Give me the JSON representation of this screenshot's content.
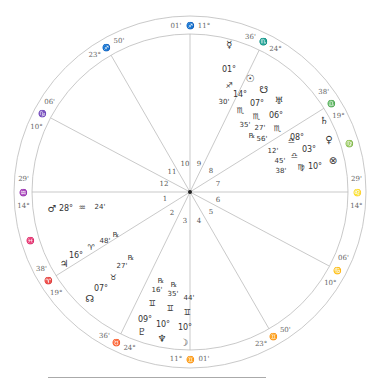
{
  "chart": {
    "center": [
      190,
      192
    ],
    "outer_radius": 176,
    "inner_radius": 158,
    "line_color": "#bbbbbb",
    "text_color": "#333333",
    "cusps": [
      {
        "house": 10,
        "deg": "11°",
        "sign": "♐",
        "min": "01'",
        "angle": 90
      },
      {
        "house": 11,
        "deg": "23°",
        "sign": "♐",
        "min": "50'",
        "angle": 120
      },
      {
        "house": 12,
        "deg": "10°",
        "sign": "♑",
        "min": "06'",
        "angle": 152
      },
      {
        "house": 1,
        "deg": "14°",
        "sign": "♒",
        "min": "29'",
        "angle": 180
      },
      {
        "house": 2,
        "deg": "19°",
        "sign": "♈",
        "min": "38'",
        "angle": 212
      },
      {
        "house": 3,
        "deg": "24°",
        "sign": "♉",
        "min": "36'",
        "angle": 244
      },
      {
        "house": 4,
        "deg": "11°",
        "sign": "♊",
        "min": "01'",
        "angle": 270
      },
      {
        "house": 5,
        "deg": "23°",
        "sign": "♊",
        "min": "50'",
        "angle": 300
      },
      {
        "house": 6,
        "deg": "10°",
        "sign": "♋",
        "min": "06'",
        "angle": 332
      },
      {
        "house": 7,
        "deg": "14°",
        "sign": "♌",
        "min": "29'",
        "angle": 0
      },
      {
        "house": 8,
        "deg": "19°",
        "sign": "♎",
        "min": "38'",
        "angle": 32
      },
      {
        "house": 9,
        "deg": "24°",
        "sign": "♏",
        "min": "36'",
        "angle": 64
      }
    ],
    "intercepted_signs": [
      {
        "sign": "♍",
        "angle": 17
      },
      {
        "sign": "♓",
        "angle": 197
      }
    ],
    "house_numbers": [
      {
        "n": "10",
        "x": 185,
        "y": 166
      },
      {
        "n": "9",
        "x": 199,
        "y": 166
      },
      {
        "n": "8",
        "x": 211,
        "y": 173
      },
      {
        "n": "11",
        "x": 172,
        "y": 174
      },
      {
        "n": "12",
        "x": 164,
        "y": 186
      },
      {
        "n": "7",
        "x": 218,
        "y": 186
      },
      {
        "n": "1",
        "x": 165,
        "y": 201
      },
      {
        "n": "6",
        "x": 218,
        "y": 202
      },
      {
        "n": "2",
        "x": 172,
        "y": 215
      },
      {
        "n": "5",
        "x": 211,
        "y": 214
      },
      {
        "n": "3",
        "x": 185,
        "y": 223
      },
      {
        "n": "4",
        "x": 199,
        "y": 223
      }
    ],
    "planets": [
      {
        "name": "mercury",
        "glyph": "☿",
        "deg": "01°",
        "sign": "♐",
        "min": "30'",
        "retro": false,
        "x": 229,
        "y": 48,
        "layout": "vertical"
      },
      {
        "name": "sun",
        "glyph": "☉",
        "deg": "14°",
        "sign": "♏",
        "min": "35'",
        "retro": false
      },
      {
        "name": "south-node",
        "glyph": "☋",
        "deg": "07°",
        "sign": "♏",
        "min": "27'",
        "retro": false
      },
      {
        "name": "uranus",
        "glyph": "♅",
        "deg": "06°",
        "sign": "♏",
        "min": "56'",
        "retro": true
      },
      {
        "name": "saturn",
        "glyph": "♄",
        "deg": "08°",
        "sign": "♎",
        "min": "12'",
        "retro": false
      },
      {
        "name": "venus",
        "glyph": "♀",
        "deg": "03°",
        "sign": "♎",
        "min": "45'",
        "retro": false
      },
      {
        "name": "part-of-fortune",
        "glyph": "⊗",
        "deg": "10°",
        "sign": "♍",
        "min": "38'",
        "retro": false
      },
      {
        "name": "mars",
        "glyph": "♂",
        "deg": "28°",
        "sign": "♒",
        "min": "24'",
        "retro": false
      },
      {
        "name": "jupiter",
        "glyph": "♃",
        "deg": "16°",
        "sign": "♈",
        "min": "48'",
        "retro": true
      },
      {
        "name": "north-node",
        "glyph": "☊",
        "deg": "07°",
        "sign": "♉",
        "min": "27'",
        "retro": true
      },
      {
        "name": "pluto",
        "glyph": "♇",
        "deg": "09°",
        "sign": "♊",
        "min": "16'",
        "retro": true
      },
      {
        "name": "neptune",
        "glyph": "♆",
        "deg": "10°",
        "sign": "♊",
        "min": "35'",
        "retro": true
      },
      {
        "name": "moon",
        "glyph": "☽",
        "deg": "10°",
        "sign": "♊",
        "min": "44'",
        "retro": false
      }
    ],
    "retro_mark": "℞"
  }
}
